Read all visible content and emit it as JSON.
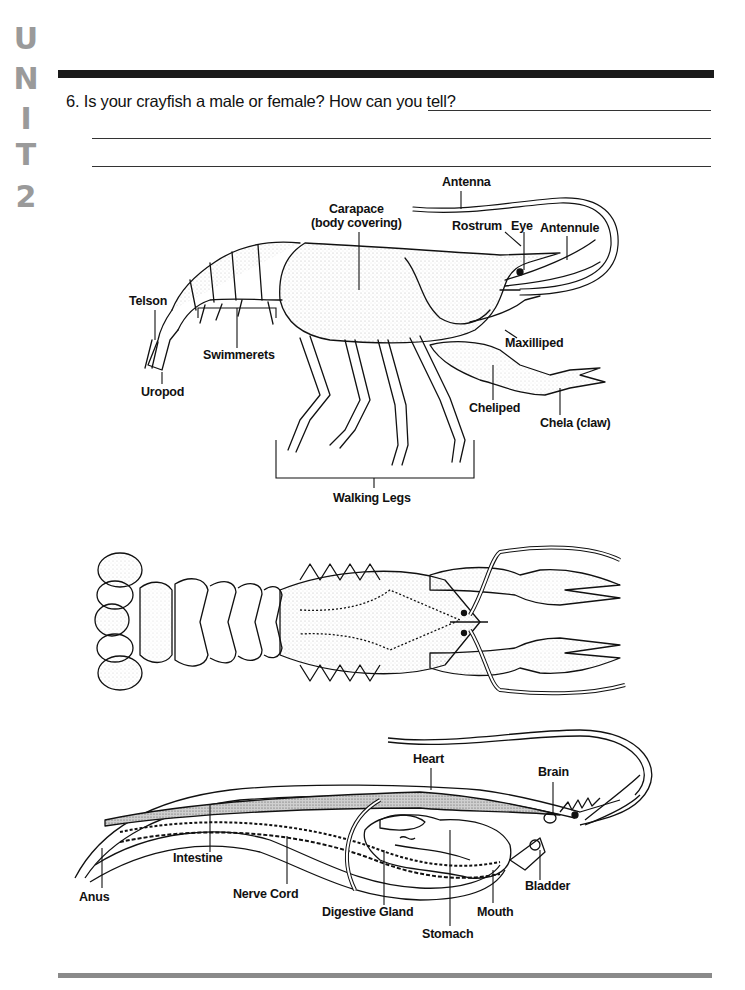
{
  "sidebar": {
    "unit_letters": [
      "U",
      "N",
      "I",
      "T",
      "2"
    ]
  },
  "question": {
    "number": "6.",
    "text": "Is your crayfish a male or female? How can you tell?",
    "answer_lines": 3
  },
  "diagrams": {
    "external_side_view": {
      "labels": {
        "antenna": "Antenna",
        "carapace": "Carapace",
        "carapace_sub": "(body covering)",
        "rostrum": "Rostrum",
        "eye": "Eye",
        "antennule": "Antennule",
        "telson": "Telson",
        "swimmerets": "Swimmerets",
        "uropod": "Uropod",
        "maxilliped": "Maxilliped",
        "cheliped": "Cheliped",
        "chela": "Chela (claw)",
        "walking_legs": "Walking Legs"
      }
    },
    "dorsal_view": {
      "labels": {}
    },
    "internal_view": {
      "labels": {
        "heart": "Heart",
        "brain": "Brain",
        "intestine": "Intestine",
        "anus": "Anus",
        "nerve_cord": "Nerve Cord",
        "digestive_gland": "Digestive Gland",
        "stomach": "Stomach",
        "mouth": "Mouth",
        "bladder": "Bladder"
      }
    }
  },
  "colors": {
    "unit_tab": "#9a9a9a",
    "top_rule": "#1a1a1a",
    "bottom_rule": "#8a8a8a"
  }
}
